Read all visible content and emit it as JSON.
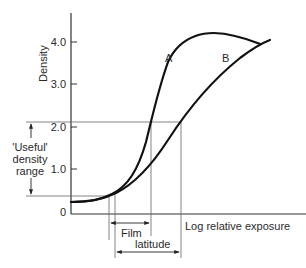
{
  "diagram": {
    "type": "characteristic-curve",
    "y_axis": {
      "label": "Density",
      "ticks": [
        "4.0",
        "3.0",
        "2.0",
        "1.0",
        "0"
      ]
    },
    "x_axis": {
      "label": "Log relative exposure"
    },
    "curves": [
      {
        "name": "A"
      },
      {
        "name": "B"
      }
    ],
    "annotations": {
      "useful_range_line1": "'Useful'",
      "useful_range_line2": "density",
      "useful_range_line3": "range",
      "film_latitude_line1": "Film",
      "film_latitude_line2": "latitude"
    },
    "colors": {
      "curve": "#111111",
      "axis": "#333333",
      "guide": "#777777"
    }
  }
}
